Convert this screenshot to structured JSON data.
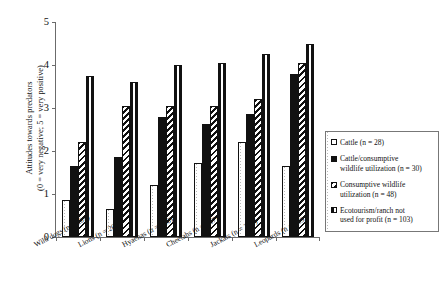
{
  "chart_data": {
    "type": "bar",
    "title": "",
    "xlabel": "",
    "ylabel": "Attitudes towards predators (0 = very negative; 5 = very positive)",
    "ylabel_line1": "Attitudes towards predators",
    "ylabel_line2": "(0 = very negative; 5 = very positive)",
    "ylim": [
      0,
      5
    ],
    "yticks": [
      "0",
      "1",
      "2",
      "3",
      "4",
      "5"
    ],
    "grid": false,
    "legend_position": "right",
    "categories": [
      "Wild dogs (n = 209)",
      "Lions (n = 209)",
      "Hyaenas (n = 208)",
      "Cheetahs (n = 207)",
      "Jackals (n = 208)",
      "Leopards (n = 209)"
    ],
    "category_names": [
      "Wild dogs",
      "Lions",
      "Hyaenas",
      "Cheetahs",
      "Jackals",
      "Leopards"
    ],
    "category_counts": [
      209,
      209,
      208,
      207,
      208,
      209
    ],
    "series": [
      {
        "name": "Cattle (n = 28)",
        "label_line1": "Cattle (n = 28)",
        "label_line2": "",
        "pattern": "open",
        "n": 28,
        "values": [
          0.85,
          0.65,
          1.2,
          1.72,
          2.2,
          1.65
        ]
      },
      {
        "name": "Cattle/consumptive wildlife utilization (n = 30)",
        "label_line1": "Cattle/consumptive",
        "label_line2": "wildlife utilization (n = 30)",
        "pattern": "solid",
        "n": 30,
        "values": [
          1.65,
          1.85,
          2.8,
          2.62,
          2.85,
          3.78
        ]
      },
      {
        "name": "Consumptive wildlife utilization (n = 48)",
        "label_line1": "Consumptive wildlife",
        "label_line2": "utilization (n = 48)",
        "pattern": "diagonal",
        "n": 48,
        "values": [
          2.22,
          3.05,
          3.05,
          3.05,
          3.2,
          4.05
        ]
      },
      {
        "name": "Ecotourism/ranch not used for profit (n = 103)",
        "label_line1": "Ecotourism/ranch not",
        "label_line2": "used for profit (n = 103)",
        "pattern": "vertical",
        "n": 103,
        "values": [
          3.75,
          3.6,
          4.0,
          4.05,
          4.25,
          4.5
        ]
      }
    ]
  },
  "colors": {
    "axis": "#6b6b6b",
    "ink": "#111111",
    "background": "#ffffff"
  }
}
